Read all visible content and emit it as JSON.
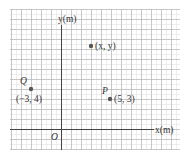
{
  "diagram": {
    "type": "coordinate-plane",
    "axes": {
      "x_label": "x(m)",
      "y_label": "y(m)",
      "origin_label": "O"
    },
    "grid": {
      "left": 10,
      "top": 9,
      "right": 180,
      "bottom": 150,
      "unit_px": 10,
      "minor_px": 5,
      "origin_px": [
        61,
        129
      ],
      "major_color": "#b9b9b9",
      "minor_color": "#e2e2e2",
      "axis_color": "#444444"
    },
    "points": [
      {
        "name": "Q",
        "label": "Q",
        "coords_label": "(−3, 4)",
        "x": -3,
        "y": 4
      },
      {
        "name": "P",
        "label": "P",
        "coords_label": "(5, 3)",
        "x": 5,
        "y": 3
      },
      {
        "name": "general",
        "label": "",
        "coords_label": "(x, y)",
        "x": 3,
        "y": 8.3
      }
    ],
    "point_color": "#555555"
  }
}
